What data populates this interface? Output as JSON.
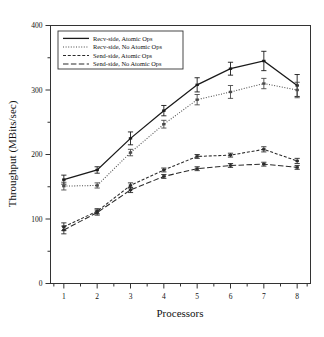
{
  "chart_data": {
    "type": "line",
    "title": "",
    "xlabel": "Processors",
    "ylabel": "Throughput (MBits/sec)",
    "x": [
      1,
      2,
      3,
      4,
      5,
      6,
      7,
      8
    ],
    "xlim": [
      0.6,
      8.4
    ],
    "ylim": [
      0,
      400
    ],
    "yticks": [
      0,
      100,
      200,
      300,
      400
    ],
    "ytick_labels": [
      "0",
      "100",
      "200",
      "300",
      "400"
    ],
    "xtick_labels": [
      "1",
      "2",
      "3",
      "4",
      "5",
      "6",
      "7",
      "8"
    ],
    "yminor_step": 50,
    "grid": false,
    "legend_position": "upper left",
    "series": [
      {
        "name": "Recv-side, Atomic Ops",
        "style": "solid",
        "color": "#1a1a1a",
        "values": [
          161,
          176,
          225,
          268,
          308,
          333,
          345,
          307
        ],
        "errors": [
          7,
          5,
          10,
          8,
          11,
          10,
          15,
          17
        ]
      },
      {
        "name": "Recv-side, No Atomic Ops",
        "style": "dotted",
        "color": "#4a4a4a",
        "values": [
          151,
          152,
          203,
          247,
          285,
          297,
          310,
          300
        ],
        "errors": [
          6,
          4,
          5,
          6,
          8,
          10,
          8,
          12
        ]
      },
      {
        "name": "Send-side, Atomic Ops",
        "style": "dashed",
        "color": "#2a2a2a",
        "values": [
          88,
          112,
          152,
          176,
          197,
          199,
          208,
          190
        ],
        "errors": [
          6,
          4,
          4,
          3,
          3,
          3,
          4,
          4
        ]
      },
      {
        "name": "Send-side, No Atomic Ops",
        "style": "longdash",
        "color": "#2a2a2a",
        "values": [
          83,
          110,
          145,
          166,
          178,
          183,
          185,
          180
        ],
        "errors": [
          6,
          4,
          4,
          3,
          3,
          3,
          3,
          3
        ]
      }
    ]
  },
  "legend": {
    "items": [
      "Recv-side, Atomic Ops",
      "Recv-side, No Atomic Ops",
      "Send-side, Atomic Ops",
      "Send-side, No Atomic Ops"
    ]
  }
}
